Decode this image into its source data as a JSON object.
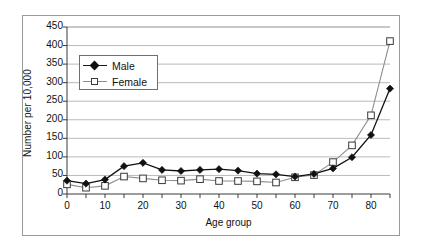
{
  "chart_data": {
    "type": "line",
    "title": "",
    "xlabel": "Age group",
    "ylabel": "Number per 10,000",
    "xlim": [
      0,
      85
    ],
    "ylim": [
      0,
      450
    ],
    "ytick_step": 50,
    "xtick_step": 5,
    "grid": "horizontal",
    "legend_position": "upper-left-inside",
    "x": [
      0,
      5,
      10,
      15,
      20,
      25,
      30,
      35,
      40,
      45,
      50,
      55,
      60,
      65,
      70,
      75,
      80,
      85
    ],
    "series": [
      {
        "name": "Male",
        "marker": "filled-diamond",
        "color": "#111111",
        "values": [
          36,
          28,
          39,
          75,
          84,
          65,
          62,
          65,
          67,
          63,
          55,
          53,
          47,
          54,
          69,
          99,
          159,
          284
        ]
      },
      {
        "name": "Female",
        "marker": "open-square",
        "color": "#8d8d8d",
        "values": [
          26,
          17,
          22,
          47,
          42,
          37,
          36,
          40,
          35,
          35,
          34,
          31,
          45,
          51,
          86,
          131,
          212,
          412
        ]
      }
    ],
    "ytick_labels": [
      "0",
      "50",
      "100",
      "150",
      "200",
      "250",
      "300",
      "350",
      "400",
      "450"
    ],
    "xtick_labels": [
      "0",
      "10",
      "20",
      "30",
      "40",
      "50",
      "60",
      "70",
      "80"
    ],
    "xtick_label_values": [
      0,
      10,
      20,
      30,
      40,
      50,
      60,
      70,
      80
    ]
  },
  "legend": {
    "items": [
      {
        "label": "Male"
      },
      {
        "label": "Female"
      }
    ]
  }
}
